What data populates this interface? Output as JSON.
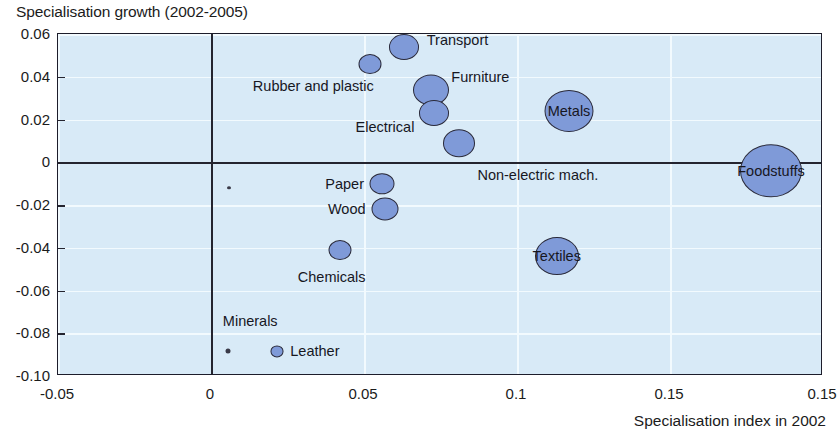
{
  "chart_data": {
    "type": "scatter",
    "variant": "bubble",
    "title": "Specialisation growth (2002-2005)",
    "ylabel": "Specialisation growth (2002-2005)",
    "xlabel": "Specialisation index in 2002",
    "xlim": [
      -0.05,
      0.2
    ],
    "ylim": [
      -0.1,
      0.06
    ],
    "xticks": [
      "-0.05",
      "0",
      "0.05",
      "0.1",
      "0.15",
      "0.15"
    ],
    "xtick_values": [
      -0.05,
      0,
      0.05,
      0.1,
      0.15,
      0.2
    ],
    "yticks": [
      "0.06",
      "0.04",
      "0.02",
      "0",
      "-0.02",
      "-0.04",
      "-0.06",
      "-0.08",
      "-0.10"
    ],
    "ytick_values": [
      0.06,
      0.04,
      0.02,
      0,
      -0.02,
      -0.04,
      -0.06,
      -0.08,
      -0.1
    ],
    "grid": "light horizontal and vertical gridlines",
    "legend": "none",
    "plot_bg": "#d8eaf7",
    "bubble_fill": "#7f9ad8",
    "bubble_stroke": "#2a2a3a",
    "points": [
      {
        "label": "Transport",
        "x": 0.063,
        "y": 0.054,
        "size": 30,
        "label_pos": "right",
        "label_inside": false
      },
      {
        "label": "Rubber and plastic",
        "x": 0.052,
        "y": 0.046,
        "size": 23,
        "label_pos": "left",
        "label_inside": false
      },
      {
        "label": "Furniture",
        "x": 0.072,
        "y": 0.034,
        "size": 36,
        "label_pos": "right",
        "label_inside": false
      },
      {
        "label": "Electrical",
        "x": 0.073,
        "y": 0.023,
        "size": 30,
        "label_pos": "left",
        "label_inside": false
      },
      {
        "label": "Non-electric mach.",
        "x": 0.081,
        "y": 0.009,
        "size": 32,
        "label_pos": "right",
        "label_inside": false
      },
      {
        "label": "Metals",
        "x": 0.117,
        "y": 0.024,
        "size": 49,
        "label_pos": "in",
        "label_inside": true
      },
      {
        "label": "Foodstuffs",
        "x": 0.183,
        "y": -0.004,
        "size": 62,
        "label_pos": "in",
        "label_inside": true
      },
      {
        "label": "Paper",
        "x": 0.056,
        "y": -0.01,
        "size": 25,
        "label_pos": "left",
        "label_inside": false
      },
      {
        "label": "Wood",
        "x": 0.057,
        "y": -0.022,
        "size": 27,
        "label_pos": "left",
        "label_inside": false
      },
      {
        "label": "Chemicals",
        "x": 0.042,
        "y": -0.041,
        "size": 23,
        "label_pos": "below",
        "label_inside": false
      },
      {
        "label": "Textiles",
        "x": 0.113,
        "y": -0.044,
        "size": 44,
        "label_pos": "in",
        "label_inside": true
      },
      {
        "label": "Minerals",
        "x": 0.006,
        "y": -0.012,
        "size": 4,
        "label_pos": "none",
        "label_inside": false
      }
    ],
    "key": {
      "minerals_label": "Minerals",
      "leather_label": "Leather",
      "minerals_x": 0.0055,
      "minerals_y": -0.0885,
      "minerals_size": 5,
      "leather_x": 0.0215,
      "leather_y": -0.0885,
      "leather_size": 13
    }
  },
  "axis": {
    "y_title": "Specialisation growth (2002-2005)",
    "x_title": "Specialisation index in 2002"
  }
}
